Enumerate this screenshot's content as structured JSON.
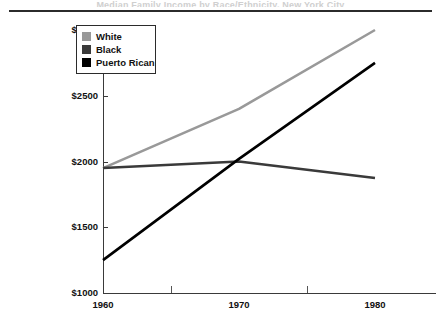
{
  "figure": {
    "title_remnant": "Median Family Income by Race/Ethnicity, New York City",
    "axis_color": "#3a3a3a"
  },
  "legend": {
    "entries": [
      {
        "label": "White",
        "color": "#999999"
      },
      {
        "label": "Black",
        "color": "#3a3a3a"
      },
      {
        "label": "Puerto Rican",
        "color": "#000000"
      }
    ]
  },
  "chart_data": {
    "type": "line",
    "title": "",
    "xlabel": "",
    "ylabel": "",
    "x": [
      1960,
      1970,
      1980
    ],
    "xtick_labels": [
      "1960",
      "1970",
      "1980"
    ],
    "ytick_labels": [
      "$1000",
      "$1500",
      "$2000",
      "$2500",
      "$3000"
    ],
    "ytick_values": [
      1000,
      1500,
      2000,
      2500,
      3000
    ],
    "ylim": [
      1000,
      3000
    ],
    "xlim": [
      1960,
      1980
    ],
    "grid": false,
    "legend_position": "top-left",
    "series": [
      {
        "name": "White",
        "color": "#999999",
        "values": [
          1950,
          2400,
          3000
        ]
      },
      {
        "name": "Black",
        "color": "#3a3a3a",
        "values": [
          1950,
          2000,
          1875
        ]
      },
      {
        "name": "Puerto Rican",
        "color": "#000000",
        "values": [
          1250,
          2020,
          2750
        ]
      }
    ]
  }
}
